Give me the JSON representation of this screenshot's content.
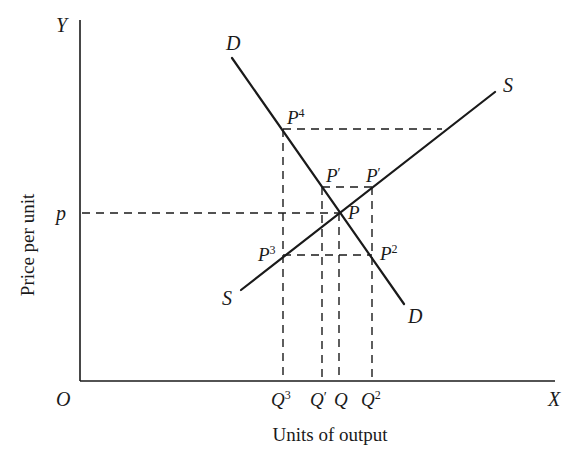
{
  "diagram": {
    "type": "supply-demand",
    "axes": {
      "origin_label": "O",
      "y_label": "Y",
      "x_label": "X",
      "y_title": "Price per unit",
      "x_title": "Units of output"
    },
    "curves": {
      "demand": {
        "label_top": "D",
        "label_bottom": "D"
      },
      "supply": {
        "label_top": "S",
        "label_bottom": "S"
      }
    },
    "price_label": "p",
    "points": {
      "P": {
        "base": "P",
        "sup": ""
      },
      "P4": {
        "base": "P",
        "sup": "4"
      },
      "P3": {
        "base": "P",
        "sup": "3"
      },
      "P2": {
        "base": "P",
        "sup": "2"
      },
      "Pprime_left": {
        "base": "P",
        "sup": "′"
      },
      "Pprime_right": {
        "base": "P",
        "sup": "′"
      }
    },
    "x_ticks": [
      {
        "base": "Q",
        "sup": "3"
      },
      {
        "base": "Q",
        "sup": "′"
      },
      {
        "base": "Q",
        "sup": ""
      },
      {
        "base": "Q",
        "sup": "2"
      }
    ]
  }
}
